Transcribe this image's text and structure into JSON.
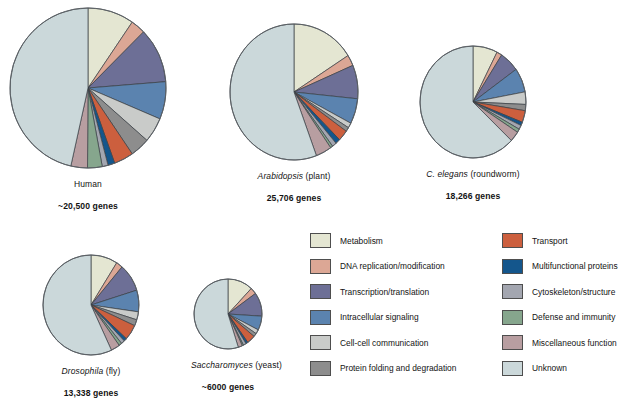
{
  "figure": {
    "background": "#ffffff"
  },
  "categories": [
    {
      "key": "metabolism",
      "label": "Metabolism",
      "color": "#e4e6d2"
    },
    {
      "key": "dna_replication",
      "label": "DNA replication/modification",
      "color": "#dca795"
    },
    {
      "key": "transcription",
      "label": "Transcription/translation",
      "color": "#6d6f96"
    },
    {
      "key": "signaling",
      "label": "Intracellular signaling",
      "color": "#5b83af"
    },
    {
      "key": "cell_communication",
      "label": "Cell-cell communication",
      "color": "#c9cbc9"
    },
    {
      "key": "protein_folding",
      "label": "Protein folding and degradation",
      "color": "#8d8d8d"
    },
    {
      "key": "transport",
      "label": "Transport",
      "color": "#cc5f3e"
    },
    {
      "key": "multifunctional",
      "label": "Multifunctional proteins",
      "color": "#14568c"
    },
    {
      "key": "cytoskeleton",
      "label": "Cytoskeleton/structure",
      "color": "#a3a6b0"
    },
    {
      "key": "defense",
      "label": "Defense and immunity",
      "color": "#86a68d"
    },
    {
      "key": "miscellaneous",
      "label": "Miscellaneous function",
      "color": "#b89ea1"
    },
    {
      "key": "unknown",
      "label": "Unknown",
      "color": "#cbd8da"
    }
  ],
  "legend": {
    "left_column": [
      {
        "label": "Metabolism",
        "color": "#e4e6d2"
      },
      {
        "label": "DNA replication/modification",
        "color": "#dca795"
      },
      {
        "label": "Transcription/translation",
        "color": "#6d6f96"
      },
      {
        "label": "Intracellular signaling",
        "color": "#5b83af"
      },
      {
        "label": "Cell-cell communication",
        "color": "#c9cbc9"
      },
      {
        "label": "Protein folding and degradation",
        "color": "#8d8d8d"
      }
    ],
    "right_column": [
      {
        "label": "Transport",
        "color": "#cc5f3e"
      },
      {
        "label": "Multifunctional proteins",
        "color": "#14568c"
      },
      {
        "label": "Cytoskeleton/structure",
        "color": "#a3a6b0"
      },
      {
        "label": "Defense and immunity",
        "color": "#86a68d"
      },
      {
        "label": "Miscellaneous function",
        "color": "#b89ea1"
      },
      {
        "label": "Unknown",
        "color": "#cbd8da"
      }
    ]
  },
  "chart_data": {
    "type": "pie",
    "shared_categories": [
      "Metabolism",
      "DNA replication/modification",
      "Transcription/translation",
      "Intracellular signaling",
      "Cell-cell communication",
      "Protein folding and degradation",
      "Transport",
      "Multifunctional proteins",
      "Cytoskeleton/structure",
      "Defense and immunity",
      "Miscellaneous function",
      "Unknown"
    ],
    "units": "percent of genes",
    "start_angle_deg": 0,
    "direction": "clockwise",
    "charts": [
      {
        "id": "human",
        "species": "Human",
        "species_italic": false,
        "common": "",
        "caption": "Human",
        "gene_count": "~20,500 genes",
        "cx": 88,
        "cy": 88,
        "rx": 78,
        "ry": 80,
        "values": [
          9.5,
          3.0,
          11.0,
          7.5,
          5.0,
          4.0,
          4.0,
          1.4,
          1.2,
          3.0,
          3.4,
          46.0
        ]
      },
      {
        "id": "arabidopsis",
        "species": "Arabidopsis",
        "species_italic": true,
        "common": "(plant)",
        "caption": "Arabidopsis (plant)",
        "gene_count": "25,706 genes",
        "cx": 294,
        "cy": 92,
        "rx": 64,
        "ry": 68,
        "values": [
          16.0,
          2.6,
          8.0,
          6.0,
          1.2,
          1.0,
          2.6,
          1.2,
          1.1,
          0.6,
          4.0,
          55.7
        ]
      },
      {
        "id": "celegans",
        "species": "C. elegans",
        "species_italic": true,
        "common": "(roundworm)",
        "caption": "C. elegans (roundworm)",
        "gene_count": "18,266 genes",
        "cx": 473,
        "cy": 102,
        "rx": 53,
        "ry": 56,
        "values": [
          7.5,
          1.6,
          6.0,
          7.0,
          3.6,
          1.8,
          3.4,
          1.0,
          1.2,
          1.0,
          3.0,
          62.9
        ]
      },
      {
        "id": "drosophila",
        "species": "Drosophila",
        "species_italic": true,
        "common": "(fly)",
        "caption": "Drosophila (fly)",
        "gene_count": "13,338  genes",
        "cx": 91,
        "cy": 305,
        "rx": 48,
        "ry": 50,
        "values": [
          9.0,
          2.2,
          9.0,
          7.0,
          2.6,
          2.0,
          5.0,
          1.0,
          1.2,
          1.0,
          3.0,
          57.0
        ]
      },
      {
        "id": "saccharomyces",
        "species": "Saccharomyces",
        "species_italic": true,
        "common": "(yeast)",
        "caption": "Saccharomyces (yeast)",
        "gene_count": "~6000  genes",
        "cx": 228,
        "cy": 314,
        "rx": 34,
        "ry": 35,
        "values": [
          12.0,
          3.0,
          11.0,
          6.5,
          2.0,
          1.6,
          4.0,
          1.0,
          1.4,
          0.6,
          2.0,
          54.9
        ]
      }
    ]
  }
}
